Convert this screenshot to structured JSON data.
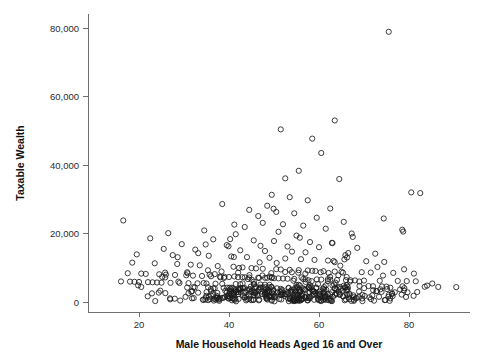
{
  "chart_data": {
    "type": "scatter",
    "title": "",
    "subtitle": "",
    "xlabel": "Male Household Heads Aged 16 and Over",
    "ylabel": "Taxable Wealth",
    "xlim": [
      12,
      92
    ],
    "ylim": [
      0,
      84000
    ],
    "x_ticks": [
      20,
      40,
      60,
      80
    ],
    "x_tick_labels": [
      "20",
      "40",
      "60",
      "80"
    ],
    "y_ticks": [
      0,
      20000,
      40000,
      60000,
      80000
    ],
    "y_tick_labels": [
      "0",
      "20,000",
      "40,000",
      "60,000",
      "80,000"
    ],
    "grid": false,
    "legend": null,
    "marker": "open-circle",
    "marker_color": "#1b1b1b",
    "background_color": "#ffffff",
    "annotations": [],
    "n_points": 620,
    "points": [
      [
        75.5,
        78900
      ],
      [
        63.5,
        53000
      ],
      [
        51.5,
        50400
      ],
      [
        58.5,
        47700
      ],
      [
        60.5,
        43500
      ],
      [
        55.5,
        38300
      ],
      [
        52.5,
        36100
      ],
      [
        64.5,
        35900
      ],
      [
        80.5,
        32000
      ],
      [
        82.5,
        31800
      ],
      [
        49.5,
        31300
      ],
      [
        53.5,
        30600
      ],
      [
        57.5,
        29700
      ],
      [
        38.5,
        28600
      ],
      [
        48.5,
        28100
      ],
      [
        62.5,
        27300
      ],
      [
        44.5,
        26900
      ],
      [
        50.5,
        26300
      ],
      [
        54.5,
        25900
      ],
      [
        46.5,
        25100
      ],
      [
        59.5,
        24600
      ],
      [
        16.5,
        23800
      ],
      [
        65.5,
        23400
      ],
      [
        47.5,
        23100
      ],
      [
        52.0,
        22700
      ],
      [
        56.5,
        22300
      ],
      [
        43.5,
        21900
      ],
      [
        61.5,
        21400
      ],
      [
        78.5,
        21100
      ],
      [
        34.5,
        20900
      ],
      [
        51.0,
        20500
      ],
      [
        26.5,
        20100
      ],
      [
        41.5,
        19800
      ],
      [
        55.0,
        19400
      ],
      [
        67.5,
        19000
      ],
      [
        22.5,
        18600
      ],
      [
        36.5,
        18300
      ],
      [
        45.5,
        18000
      ],
      [
        50.0,
        17800
      ],
      [
        58.0,
        17500
      ],
      [
        63.0,
        17200
      ],
      [
        29.5,
        16900
      ],
      [
        39.5,
        16600
      ],
      [
        47.0,
        16400
      ],
      [
        53.0,
        16200
      ],
      [
        60.0,
        16000
      ],
      [
        68.5,
        15800
      ],
      [
        25.5,
        15500
      ],
      [
        32.5,
        15300
      ],
      [
        42.5,
        15100
      ],
      [
        48.0,
        14900
      ],
      [
        54.0,
        14700
      ],
      [
        57.0,
        14500
      ],
      [
        66.5,
        14300
      ],
      [
        72.5,
        14100
      ],
      [
        19.5,
        13900
      ],
      [
        27.5,
        13700
      ],
      [
        35.5,
        13500
      ],
      [
        40.5,
        13300
      ],
      [
        44.0,
        13100
      ],
      [
        49.0,
        12900
      ],
      [
        52.5,
        12700
      ],
      [
        56.0,
        12500
      ],
      [
        59.0,
        12300
      ],
      [
        62.0,
        12100
      ],
      [
        70.5,
        11900
      ],
      [
        74.5,
        11700
      ],
      [
        18.5,
        11500
      ],
      [
        23.5,
        11300
      ],
      [
        28.5,
        11100
      ],
      [
        31.5,
        10900
      ],
      [
        33.5,
        10700
      ],
      [
        37.5,
        10500
      ],
      [
        41.0,
        10300
      ],
      [
        43.0,
        10100
      ],
      [
        45.0,
        9900
      ],
      [
        46.0,
        9800
      ],
      [
        47.5,
        9700
      ],
      [
        50.5,
        9600
      ],
      [
        51.5,
        9500
      ],
      [
        53.5,
        9400
      ],
      [
        55.5,
        9300
      ],
      [
        57.5,
        9200
      ],
      [
        58.5,
        9100
      ],
      [
        61.0,
        9000
      ],
      [
        63.5,
        8900
      ],
      [
        65.0,
        8800
      ],
      [
        69.5,
        8700
      ],
      [
        71.5,
        8600
      ],
      [
        76.5,
        8500
      ],
      [
        17.5,
        8400
      ],
      [
        20.5,
        8300
      ],
      [
        21.5,
        8200
      ],
      [
        24.5,
        8100
      ],
      [
        26.0,
        8000
      ],
      [
        28.0,
        7900
      ],
      [
        30.5,
        7800
      ],
      [
        32.0,
        7700
      ],
      [
        34.0,
        7600
      ],
      [
        36.0,
        7500
      ],
      [
        38.0,
        7400
      ],
      [
        39.0,
        7350
      ],
      [
        40.0,
        7300
      ],
      [
        42.0,
        7250
      ],
      [
        43.5,
        7200
      ],
      [
        44.5,
        7150
      ],
      [
        46.5,
        7100
      ],
      [
        48.5,
        7050
      ],
      [
        49.5,
        7000
      ],
      [
        50.0,
        6950
      ],
      [
        51.0,
        6900
      ],
      [
        52.0,
        6850
      ],
      [
        53.0,
        6800
      ],
      [
        54.5,
        6750
      ],
      [
        56.5,
        6700
      ],
      [
        57.0,
        6650
      ],
      [
        59.5,
        6600
      ],
      [
        60.5,
        6550
      ],
      [
        62.5,
        6500
      ],
      [
        64.0,
        6450
      ],
      [
        66.0,
        6400
      ],
      [
        67.0,
        6350
      ],
      [
        68.0,
        6300
      ],
      [
        70.0,
        6250
      ],
      [
        73.5,
        6200
      ],
      [
        77.5,
        6150
      ],
      [
        79.5,
        6100
      ],
      [
        81.5,
        6050
      ],
      [
        16.0,
        6000
      ],
      [
        18.0,
        5950
      ],
      [
        19.0,
        5900
      ],
      [
        20.0,
        5850
      ],
      [
        22.0,
        5800
      ],
      [
        23.0,
        5750
      ],
      [
        24.0,
        5700
      ],
      [
        25.0,
        5650
      ],
      [
        27.0,
        5600
      ],
      [
        29.0,
        5550
      ],
      [
        31.0,
        5500
      ],
      [
        33.0,
        5450
      ],
      [
        35.0,
        5400
      ],
      [
        37.0,
        5350
      ],
      [
        38.5,
        5300
      ],
      [
        41.5,
        5250
      ],
      [
        42.5,
        5200
      ],
      [
        45.5,
        5150
      ],
      [
        47.0,
        5100
      ],
      [
        48.0,
        5050
      ],
      [
        49.0,
        5000
      ],
      [
        55.0,
        4950
      ],
      [
        58.0,
        4900
      ],
      [
        61.5,
        4850
      ],
      [
        63.0,
        4800
      ],
      [
        65.5,
        4750
      ],
      [
        69.0,
        4700
      ],
      [
        71.0,
        4650
      ],
      [
        72.0,
        4600
      ],
      [
        74.0,
        4550
      ],
      [
        75.0,
        4500
      ],
      [
        83.5,
        4450
      ],
      [
        86.5,
        4400
      ],
      [
        90.5,
        4350
      ]
    ]
  },
  "axes": {
    "y_axis_name": "Taxable Wealth",
    "x_axis_name": "Male Household Heads Aged 16 and Over"
  }
}
